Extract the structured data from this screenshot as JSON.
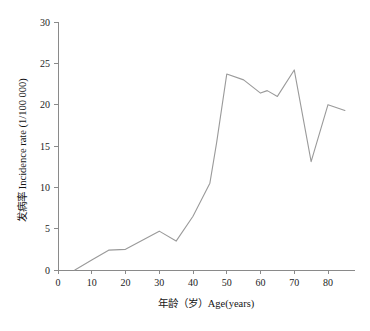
{
  "chart_data": {
    "type": "line",
    "title": "",
    "xlabel": "年龄（岁）Age(years)",
    "ylabel": "发病率 Incidence rate (1/100 000)",
    "xlim": [
      0,
      88
    ],
    "ylim": [
      0,
      30
    ],
    "xticks": [
      0,
      10,
      20,
      30,
      40,
      50,
      60,
      70,
      80
    ],
    "xtick_labels": [
      "0",
      "10",
      "20",
      "30",
      "40",
      "50",
      "60",
      "70",
      "80"
    ],
    "yticks": [
      0,
      5,
      10,
      15,
      20,
      25,
      30
    ],
    "ytick_labels": [
      "0",
      "5",
      "10",
      "15",
      "20",
      "25",
      "30"
    ],
    "grid": false,
    "legend": "none",
    "line_color": "#9a9a9a",
    "axis_color": "#8a8a8a",
    "series": [
      {
        "name": "发病率 Incidence rate",
        "x": [
          5,
          10,
          15,
          20,
          25,
          30,
          35,
          40,
          45,
          47,
          50,
          55,
          60,
          62,
          65,
          70,
          75,
          80,
          85
        ],
        "values": [
          0.0,
          1.2,
          2.4,
          2.5,
          3.6,
          4.7,
          3.5,
          6.5,
          10.5,
          15.4,
          23.7,
          23.0,
          21.4,
          21.7,
          21.0,
          24.2,
          13.1,
          20.0,
          19.3
        ]
      }
    ]
  },
  "figure": {
    "caption": ""
  }
}
